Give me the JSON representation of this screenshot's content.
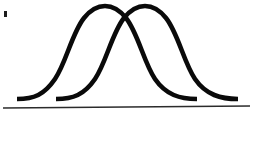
{
  "figure": {
    "background_color": "#ffffff",
    "width": 255,
    "height": 143
  },
  "chart_data": {
    "type": "line",
    "subtitle": "",
    "xlabel": "",
    "ylabel": "",
    "xlim": [
      0,
      255
    ],
    "ylim": [
      0,
      143
    ],
    "grid": false,
    "legend": "none",
    "axis_labels_visible": false,
    "tick_labels": [],
    "annotations": [],
    "baseline": {
      "name": "horizontal-axis-line",
      "x_start": 3,
      "y_start": 108,
      "x_end": 250,
      "y_end": 106,
      "color": "#2b2b2b",
      "thickness": 1.4
    },
    "series": [
      {
        "name": "bell-curve-left",
        "color": "#0a0a0a",
        "thickness": 4.6,
        "peak_x": 105,
        "peak_y": 6,
        "tail_left_x": 17,
        "tail_right_x": 197,
        "tail_y": 99,
        "path": "M 17,99 C 34,99 44,95 55,79 C 66,63 72,33 84,18 C 92,8 99,6 105,6 C 111,6 118,8 126,18 C 138,33 144,63 155,79 C 166,95 180,99 197,99"
      },
      {
        "name": "bell-curve-right",
        "color": "#0a0a0a",
        "thickness": 4.6,
        "peak_x": 145,
        "peak_y": 6,
        "tail_left_x": 56,
        "tail_right_x": 238,
        "tail_y": 99,
        "path": "M 56,99 C 73,99 84,95 95,79 C 106,63 112,33 124,18 C 132,8 139,6 145,6 C 151,6 158,8 166,18 C 178,33 184,63 195,79 C 206,95 221,99 238,99"
      }
    ],
    "intersection_points": [
      {
        "name": "curve-crossing-point",
        "x": 124,
        "y": 22
      }
    ],
    "artifacts": [
      {
        "name": "scan-speck",
        "x": 4,
        "y": 11,
        "width": 3,
        "height": 6,
        "color": "#1c1c1c"
      }
    ]
  }
}
